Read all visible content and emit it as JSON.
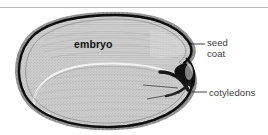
{
  "figure": {
    "type": "botanical-cross-section-illustration",
    "background_color": "#ffffff",
    "rule_color": "#b9b9b9",
    "ink_color": "#131313"
  },
  "labels": {
    "embryo": "embryo",
    "seed_coat_line1": "seed",
    "seed_coat_line2": "coat",
    "cotyledons": "cotyledons"
  },
  "colors": {
    "text": "#3a3a3a",
    "embryo_text": "#131313",
    "seed_coat_outline": "#0d0d0d",
    "seed_interior": "#c8c8c8",
    "seed_interior_light": "#d8d8d8",
    "leader_line": "#2a2a2a",
    "inner_highlight": "#f2f2f2"
  },
  "leaders": {
    "seed_coat": "dash from seed coat edge to seed/coat label",
    "cotyledons_upper": "line from upper cotyledon body to notch",
    "cotyledons_lower": "line from lower cotyledon body to notch",
    "cotyledons_out": "dash from notch to cotyledons label"
  }
}
